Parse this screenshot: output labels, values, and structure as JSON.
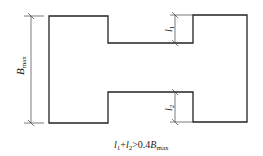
{
  "diagram": {
    "labels": {
      "B_main": "B",
      "B_sub": "max",
      "l1_main": "l",
      "l1_sub": "1",
      "l2_main": "l",
      "l2_sub": "2"
    },
    "formula": {
      "l1": "l",
      "l1_sub": "1",
      "plus": "+",
      "l2": "l",
      "l2_sub": "2",
      "rel": ">0.4",
      "B": "B",
      "B_sub": "max"
    },
    "colors": {
      "stroke": "#222222",
      "background": "#ffffff"
    }
  }
}
